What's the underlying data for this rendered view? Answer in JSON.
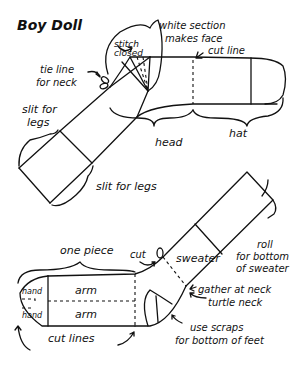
{
  "title": "Boy Doll",
  "top_diagram": {
    "labels": {
      "white_section": "white section",
      "makes_face": "makes face",
      "cut_line": "cut line",
      "stitch": "stitch",
      "closed": "closed",
      "tie_line": "tie line",
      "for_neck": "for neck",
      "slit_for": "slit for",
      "legs": "legs",
      "slit_for_legs": "slit for legs",
      "head": "head",
      "hat": "hat"
    }
  },
  "bottom_diagram": {
    "labels": {
      "one_piece": "one piece",
      "cut": "cut",
      "sweater": "sweater",
      "roll": "roll",
      "for_bottom": "for bottom",
      "of_sweater": "of sweater",
      "hand_top": "hand",
      "hand_bottom": "hand",
      "arm_top": "arm",
      "arm_bottom": "arm",
      "gather_at_neck": "gather at neck",
      "turtle_neck": "turtle neck",
      "use_scraps": "use scraps",
      "for_bottom_of_feet": "for bottom of feet",
      "cut_lines": "cut lines"
    }
  }
}
